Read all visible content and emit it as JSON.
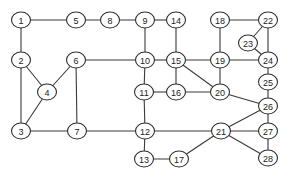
{
  "diagram": {
    "type": "undirected-graph",
    "colors": {
      "background": "#ffffff",
      "stroke": "#2e2e2e",
      "text": "#222222"
    },
    "nodes": [
      {
        "id": "1",
        "label": "1",
        "x": 21,
        "y": 20
      },
      {
        "id": "2",
        "label": "2",
        "x": 21,
        "y": 60
      },
      {
        "id": "3",
        "label": "3",
        "x": 21,
        "y": 131
      },
      {
        "id": "4",
        "label": "4",
        "x": 47,
        "y": 92
      },
      {
        "id": "5",
        "label": "5",
        "x": 76,
        "y": 20
      },
      {
        "id": "6",
        "label": "6",
        "x": 76,
        "y": 60
      },
      {
        "id": "7",
        "label": "7",
        "x": 77,
        "y": 131
      },
      {
        "id": "8",
        "label": "8",
        "x": 110,
        "y": 20
      },
      {
        "id": "9",
        "label": "9",
        "x": 145,
        "y": 20
      },
      {
        "id": "10",
        "label": "10",
        "x": 145,
        "y": 60
      },
      {
        "id": "11",
        "label": "11",
        "x": 144,
        "y": 92
      },
      {
        "id": "12",
        "label": "12",
        "x": 145,
        "y": 131
      },
      {
        "id": "13",
        "label": "13",
        "x": 144,
        "y": 159
      },
      {
        "id": "14",
        "label": "14",
        "x": 176,
        "y": 20
      },
      {
        "id": "15",
        "label": "15",
        "x": 176,
        "y": 60
      },
      {
        "id": "16",
        "label": "16",
        "x": 176,
        "y": 92
      },
      {
        "id": "17",
        "label": "17",
        "x": 179,
        "y": 159
      },
      {
        "id": "18",
        "label": "18",
        "x": 220,
        "y": 20
      },
      {
        "id": "19",
        "label": "19",
        "x": 220,
        "y": 60
      },
      {
        "id": "20",
        "label": "20",
        "x": 220,
        "y": 92
      },
      {
        "id": "21",
        "label": "21",
        "x": 221,
        "y": 131
      },
      {
        "id": "22",
        "label": "22",
        "x": 268,
        "y": 20
      },
      {
        "id": "23",
        "label": "23",
        "x": 248,
        "y": 43
      },
      {
        "id": "24",
        "label": "24",
        "x": 268,
        "y": 60
      },
      {
        "id": "25",
        "label": "25",
        "x": 268,
        "y": 82
      },
      {
        "id": "26",
        "label": "26",
        "x": 268,
        "y": 106
      },
      {
        "id": "27",
        "label": "27",
        "x": 268,
        "y": 131
      },
      {
        "id": "28",
        "label": "28",
        "x": 268,
        "y": 158
      }
    ],
    "edges": [
      [
        "1",
        "5"
      ],
      [
        "5",
        "8"
      ],
      [
        "8",
        "9"
      ],
      [
        "9",
        "14"
      ],
      [
        "1",
        "2"
      ],
      [
        "2",
        "4"
      ],
      [
        "2",
        "3"
      ],
      [
        "4",
        "6"
      ],
      [
        "4",
        "3"
      ],
      [
        "3",
        "7"
      ],
      [
        "6",
        "7"
      ],
      [
        "6",
        "10"
      ],
      [
        "9",
        "10"
      ],
      [
        "10",
        "15"
      ],
      [
        "10",
        "11"
      ],
      [
        "11",
        "16"
      ],
      [
        "11",
        "12"
      ],
      [
        "14",
        "15"
      ],
      [
        "15",
        "16"
      ],
      [
        "15",
        "19"
      ],
      [
        "15",
        "20"
      ],
      [
        "16",
        "20"
      ],
      [
        "18",
        "19"
      ],
      [
        "18",
        "22"
      ],
      [
        "19",
        "24"
      ],
      [
        "19",
        "20"
      ],
      [
        "22",
        "23"
      ],
      [
        "22",
        "24"
      ],
      [
        "23",
        "24"
      ],
      [
        "24",
        "25"
      ],
      [
        "25",
        "26"
      ],
      [
        "20",
        "26"
      ],
      [
        "7",
        "12"
      ],
      [
        "12",
        "21"
      ],
      [
        "12",
        "13"
      ],
      [
        "13",
        "17"
      ],
      [
        "17",
        "21"
      ],
      [
        "21",
        "26"
      ],
      [
        "21",
        "27"
      ],
      [
        "21",
        "28"
      ],
      [
        "26",
        "27"
      ],
      [
        "27",
        "28"
      ]
    ]
  }
}
